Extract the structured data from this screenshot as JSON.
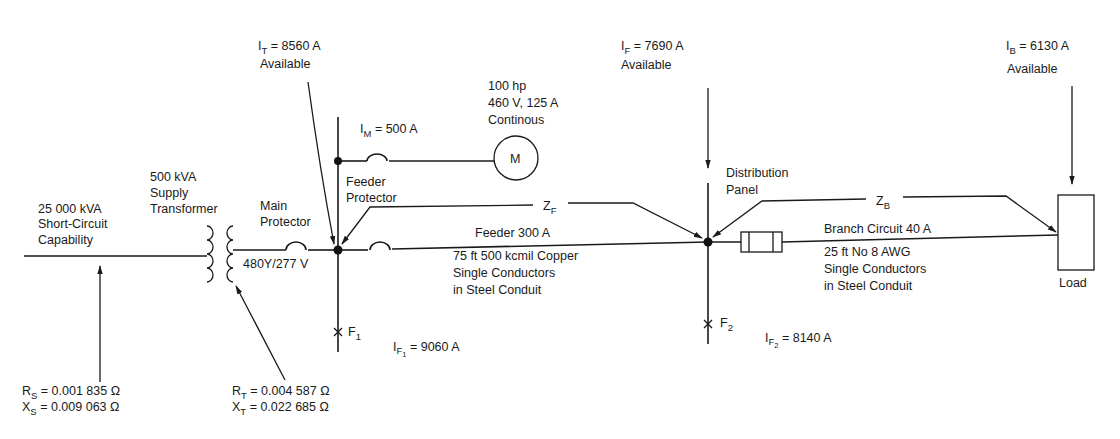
{
  "diagram": {
    "source": {
      "label_line1": "25  000 kVA",
      "label_line2": "Short-Circuit",
      "label_line3": "Capability",
      "rs_symbol": "R",
      "rs_sub": "S",
      "rs_value": " = 0.001 835 Ω",
      "xs_symbol": "X",
      "xs_sub": "S",
      "xs_value": " = 0.009 063 Ω"
    },
    "transformer": {
      "label_line1": "500 kVA",
      "label_line2": "Supply",
      "label_line3": "Transformer",
      "voltage": "480Y/277  V",
      "rt_symbol": "R",
      "rt_sub": "T",
      "rt_value": "  = 0.004 587 Ω",
      "xt_symbol": "X",
      "xt_sub": "T",
      "xt_value": "  = 0.022 685 Ω"
    },
    "main_protector": {
      "label_line1": "Main",
      "label_line2": "Protector"
    },
    "transformer_current": {
      "symbol": "I",
      "sub": "T",
      "value": "  = 8560  A",
      "note": "Available"
    },
    "motor": {
      "symbol": "M",
      "rating_line1": "100  hp",
      "rating_line2": "460 V, 125 A",
      "rating_line3": "Continous",
      "current_symbol": "I",
      "current_sub": "M",
      "current_value": "  =  500 A"
    },
    "feeder_protector": {
      "label_line1": "Feeder",
      "label_line2": "Protector"
    },
    "feeder": {
      "impedance_symbol": "Z",
      "impedance_sub": "F",
      "label": "Feeder  300 A",
      "desc_line1": "75 ft 500 kcmil Copper",
      "desc_line2": "Single Conductors",
      "desc_line3": "in Steel Conduit"
    },
    "fault1": {
      "symbol": "F",
      "sub": "1",
      "current_symbol": "I",
      "current_sub": "F",
      "current_subsub": "1",
      "current_value": " = 9060  A"
    },
    "panel_current": {
      "symbol": "I",
      "sub": "F",
      "value": "  = 7690  A",
      "note": "Available"
    },
    "distribution_panel": {
      "label_line1": "Distribution",
      "label_line2": "Panel"
    },
    "branch": {
      "impedance_symbol": "Z",
      "impedance_sub": "B",
      "label": "Branch Circuit 40 A",
      "desc_line1": "25 ft  No  8 AWG",
      "desc_line2": "Single Conductors",
      "desc_line3": "in Steel Conduit"
    },
    "fault2": {
      "symbol": "F",
      "sub": "2",
      "current_symbol": "I",
      "current_sub": "F",
      "current_subsub": "2",
      "current_value": " = 8140  A"
    },
    "load_current": {
      "symbol": "I",
      "sub": "B",
      "value": " = 6130  A",
      "note": "Available"
    },
    "load": {
      "label": "Load"
    }
  }
}
